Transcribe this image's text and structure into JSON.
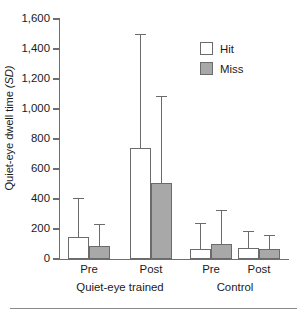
{
  "figure": {
    "background": "#ffffff",
    "axis_color": "#6e6e6e",
    "bar_border_color": "#6b6b6b",
    "hit_color": "#ffffff",
    "miss_color": "#a8a8a8"
  },
  "axes": {
    "ylabel_main": "Quiet-eye dwell time ",
    "ylabel_italic": "(SD)",
    "yticks": [
      0,
      200,
      400,
      600,
      800,
      1000,
      1200,
      1400,
      1600
    ],
    "ytick_labels": [
      "0",
      "200",
      "400",
      "600",
      "800",
      "1,000",
      "1,200",
      "1,400",
      "1,600"
    ],
    "ylim": [
      0,
      1600
    ],
    "xtick_labels": [
      "Pre",
      "Post",
      "Pre",
      "Post"
    ],
    "group_labels": [
      "Quiet-eye trained",
      "Control"
    ]
  },
  "legend": {
    "position": "top-right",
    "entries": [
      {
        "label": "Hit",
        "swatch": "hit"
      },
      {
        "label": "Miss",
        "swatch": "miss"
      }
    ]
  },
  "chart_data": {
    "type": "bar",
    "title": "",
    "xlabel": "",
    "ylabel": "Quiet-eye dwell time (SD)",
    "ylim": [
      0,
      1600
    ],
    "grid": false,
    "legend_position": "top-right",
    "error_bars": "upper only (SD)",
    "categories": [
      "Pre",
      "Post",
      "Pre",
      "Post"
    ],
    "groups": [
      "Quiet-eye trained",
      "Quiet-eye trained",
      "Control",
      "Control"
    ],
    "series": [
      {
        "name": "Hit",
        "color": "#ffffff",
        "values": [
          145,
          740,
          70,
          75
        ],
        "error_upper": [
          405,
          1500,
          240,
          190
        ]
      },
      {
        "name": "Miss",
        "color": "#a8a8a8",
        "values": [
          85,
          510,
          100,
          65
        ],
        "error_upper": [
          235,
          1090,
          330,
          160
        ]
      }
    ]
  }
}
